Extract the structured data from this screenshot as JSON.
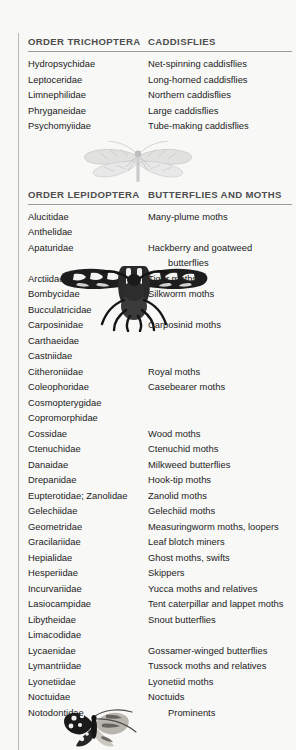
{
  "document": {
    "background_color": "#f8f8f7",
    "text_color": "#232323",
    "header_color": "#4e4e4e",
    "rule_color": "#9b9b9b"
  },
  "sections": [
    {
      "order_label": "ORDER TRICHOPTERA",
      "common_label": "CADDISFLIES",
      "rows": [
        {
          "family": "Hydropsychidae",
          "common": "Net-spinning caddisflies"
        },
        {
          "family": "Leptoceridae",
          "common": "Long-horned caddisflies"
        },
        {
          "family": "Limnephilidae",
          "common": "Northern caddisflies"
        },
        {
          "family": "Phryganeidae",
          "common": "Large caddisflies"
        },
        {
          "family": "Psychomyiidae",
          "common": "Tube-making caddisflies"
        }
      ]
    },
    {
      "order_label": "ORDER LEPIDOPTERA",
      "common_label": "BUTTERFLIES AND MOTHS",
      "rows": [
        {
          "family": "Alucitidae",
          "common": "Many-plume moths"
        },
        {
          "family": "Anthelidae",
          "common": ""
        },
        {
          "family": "Apaturidae",
          "common": "Hackberry and goatweed"
        },
        {
          "family": "",
          "common": "butterflies",
          "indent": true
        },
        {
          "family": "Arctiidae",
          "common": "Tiger moths"
        },
        {
          "family": "Bombycidae",
          "common": "Silkworm moths"
        },
        {
          "family": "Bucculatricidae",
          "common": ""
        },
        {
          "family": "Carposinidae",
          "common": "Carposinid moths"
        },
        {
          "family": "Carthaeidae",
          "common": ""
        },
        {
          "family": "Castniidae",
          "common": ""
        },
        {
          "family": "Citheroniidae",
          "common": "Royal moths"
        },
        {
          "family": "Coleophoridae",
          "common": "Casebearer moths"
        },
        {
          "family": "Cosmopterygidae",
          "common": ""
        },
        {
          "family": "Copromorphidae",
          "common": ""
        },
        {
          "family": "Cossidae",
          "common": "Wood moths"
        },
        {
          "family": "Ctenuchidae",
          "common": "Ctenuchid moths"
        },
        {
          "family": "Danaidae",
          "common": "Milkweed butterflies"
        },
        {
          "family": "Drepanidae",
          "common": "Hook-tip moths"
        },
        {
          "family": "Eupterotidae; Zanolidae",
          "common": "Zanolid moths"
        },
        {
          "family": "Gelechiidae",
          "common": "Gelechiid moths"
        },
        {
          "family": "Geometridae",
          "common": "Measuringworm moths, loopers"
        },
        {
          "family": "Gracilariidae",
          "common": "Leaf blotch miners"
        },
        {
          "family": "Hepialidae",
          "common": "Ghost moths, swifts"
        },
        {
          "family": "Hesperiidae",
          "common": "Skippers"
        },
        {
          "family": "Incurvariidae",
          "common": "Yucca moths and relatives"
        },
        {
          "family": "Lasiocampidae",
          "common": "Tent caterpillar and lappet moths"
        },
        {
          "family": "Libytheidae",
          "common": "Snout butterflies"
        },
        {
          "family": "Limacodidae",
          "common": ""
        },
        {
          "family": "Lycaenidae",
          "common": "Gossamer-winged butterflies"
        },
        {
          "family": "Lymantriidae",
          "common": "Tussock moths and relatives"
        },
        {
          "family": "Lyonetiidae",
          "common": "Lyonetiid moths"
        },
        {
          "family": "Noctuidae",
          "common": "Noctuids"
        },
        {
          "family": "Notodontidae",
          "common": "Prominents",
          "indent": true
        }
      ]
    }
  ],
  "illustrations": [
    {
      "name": "caddisfly-illustration",
      "caption": ""
    },
    {
      "name": "moth-illustration",
      "caption": ""
    },
    {
      "name": "butterfly-illustration",
      "caption": ""
    }
  ]
}
